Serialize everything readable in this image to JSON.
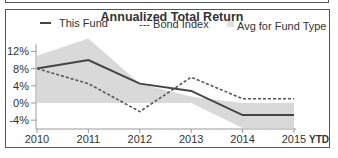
{
  "chart_data": {
    "type": "line",
    "title": "Annualized Total Return",
    "xlabel": "",
    "ylabel": "",
    "categories": [
      "2010",
      "2011",
      "2012",
      "2013",
      "2014",
      "2015"
    ],
    "x_suffix_label": "YTD",
    "yticks": [
      "12%",
      "8%",
      "4%",
      "0%",
      "-4%"
    ],
    "ylim": [
      -6,
      15
    ],
    "grid": false,
    "legend_position": "top",
    "series": [
      {
        "name": "This Fund",
        "style": "solid",
        "color": "#444444",
        "values": [
          8.0,
          10.0,
          4.5,
          2.8,
          -2.8,
          -2.8
        ]
      },
      {
        "name": "Bond Index",
        "style": "dashed",
        "color": "#555555",
        "values": [
          8.0,
          4.5,
          -2.0,
          6.0,
          1.0,
          1.0
        ]
      },
      {
        "name": "Avg for Fund Type",
        "style": "band",
        "color": "#d9d9d9",
        "upper": [
          11.0,
          15.0,
          4.5,
          1.5,
          0.0,
          0.0
        ],
        "lower": [
          0.0,
          0.0,
          0.0,
          0.0,
          -5.8,
          -5.8
        ]
      }
    ]
  },
  "legend": {
    "fund": "This Fund",
    "bond": "--- Bond Index",
    "avg": "Avg for Fund Type"
  },
  "x_ytd": "YTD"
}
